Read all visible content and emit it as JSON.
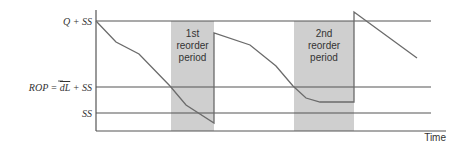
{
  "diagram": {
    "colors": {
      "line": "#555555",
      "curve": "#6b6b6b",
      "band": "#cfcfcf",
      "text": "#333333"
    },
    "y_labels": {
      "top": "Q + SS",
      "rop": "ROP = dL + SS",
      "rop_prefix": "ROP = ",
      "rop_dl": "dL",
      "rop_suffix": " + SS",
      "ss": "SS"
    },
    "x_label": "Time",
    "bands": [
      {
        "line1": "1st",
        "line2": "reorder",
        "line3": "period"
      },
      {
        "line1": "2nd",
        "line2": "reorder",
        "line3": "period"
      }
    ]
  }
}
